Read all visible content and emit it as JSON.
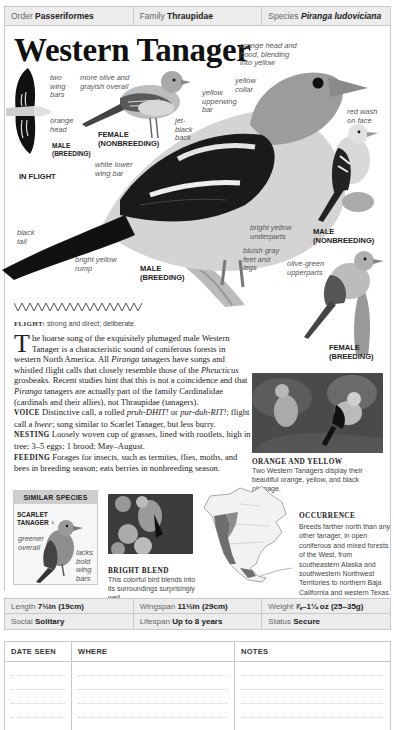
{
  "header": {
    "order_label": "Order",
    "order_value": "Passeriformes",
    "family_label": "Family",
    "family_value": "Thraupidae",
    "species_label": "Species",
    "species_value": "Piranga ludoviciana"
  },
  "title": "Western Tanager",
  "annotations": {
    "two_wing_bars": "two wing bars",
    "orange_head": "orange head",
    "more_olive": "more olive and grayish overall",
    "orange_hood": "orange head and hood, blending into yellow",
    "yellow_collar": "yellow collar",
    "yellow_upperwing": "yellow upperwing bar",
    "jet_black_back": "jet-black back",
    "red_wash": "red wash on face",
    "white_lower_wing": "white lower wing bar",
    "black_tail": "black tail",
    "bright_yellow_rump": "bright yellow rump",
    "bright_yellow_underparts": "bright yellow underparts",
    "bluish_gray_feet": "bluish gray feet and legs",
    "olive_green_upperparts": "olive-green upperparts",
    "greener_overall": "greener overall",
    "lacks_bold_wing_bars": "lacks bold wing bars"
  },
  "tags": {
    "male_breeding_flight": "MALE (BREEDING)",
    "in_flight": "IN FLIGHT",
    "female_nonbreeding": "FEMALE (NONBREEDING)",
    "male_breeding": "MALE (BREEDING)",
    "male_nonbreeding": "MALE (NONBREEDING)",
    "female_breeding": "FEMALE (BREEDING)",
    "scarlet_tanager": "SCARLET TANAGER ♀"
  },
  "flight": {
    "label": "FLIGHT:",
    "text": " strong and direct; deliberate."
  },
  "description": {
    "dropcap": "T",
    "intro_1": "he hoarse song of the exquisitely plumaged male Western Tanager is a characteristic sound of coniferous forests in western North America. All ",
    "genus_1": "Piranga",
    "intro_2": " tanagers have songs and whistled flight calls that closely resemble those of the ",
    "genus_2": "Pheucticus",
    "intro_3": " grosbeaks. Recent studies hint that this is not a coincidence and that ",
    "genus_3": "Piranga",
    "intro_4": " tanagers are actually part of the family Cardinalidae (cardinals and their allies), not Thraupidae (tanagers).",
    "voice_label": "VOICE",
    "voice_1": " Distinctive call, a rolled ",
    "voice_call_1": "pruh-DHIT!",
    "voice_2": " or ",
    "voice_call_2": "pur-duh-RIT!",
    "voice_3": "; flight call a ",
    "voice_call_3": "hwee",
    "voice_4": "; song similar to Scarlet Tanager, but less burry.",
    "nesting_label": "NESTING",
    "nesting": " Loosely woven cup of grasses, lined with rootlets, high in tree; 3–5 eggs; 1 brood; May–August.",
    "feeding_label": "FEEDING",
    "feeding": " Forages for insects, such as termites, flies, moths, and bees in breeding season; eats berries in nonbreeding season."
  },
  "photos": {
    "orange_yellow_title": "ORANGE AND YELLOW",
    "orange_yellow_caption": "Two Western Tanagers display their beautiful orange, yellow, and black plumage.",
    "bright_blend_title": "BRIGHT BLEND",
    "bright_blend_caption": "This colorful bird blends into its surroundings surprisingly well."
  },
  "similar_species": {
    "header": "SIMILAR SPECIES"
  },
  "occurrence": {
    "title": "OCCURRENCE",
    "text": "Breeds farther north than any other tanager, in open coniferous and mixed forests of the West, from southeastern Alaska and southwestern Northwest Territories to northern Baja California and western Texas. Winters from southern California and southward to Mexico."
  },
  "stats": {
    "length_label": "Length",
    "length_value": "7½in (19cm)",
    "wingspan_label": "Wingspan",
    "wingspan_value": "11½in (29cm)",
    "weight_label": "Weight",
    "weight_value": "⅞–1¼ oz (25–35g)",
    "social_label": "Social",
    "social_value": "Solitary",
    "lifespan_label": "Lifespan",
    "lifespan_value": "Up to 8 years",
    "status_label": "Status",
    "status_value": "Secure"
  },
  "log": {
    "col_date": "DATE SEEN",
    "col_where": "WHERE",
    "col_notes": "NOTES"
  },
  "colors": {
    "bar_bg": "#ececec",
    "border": "#c9c9c9",
    "text": "#222222",
    "annotation": "#555555"
  }
}
